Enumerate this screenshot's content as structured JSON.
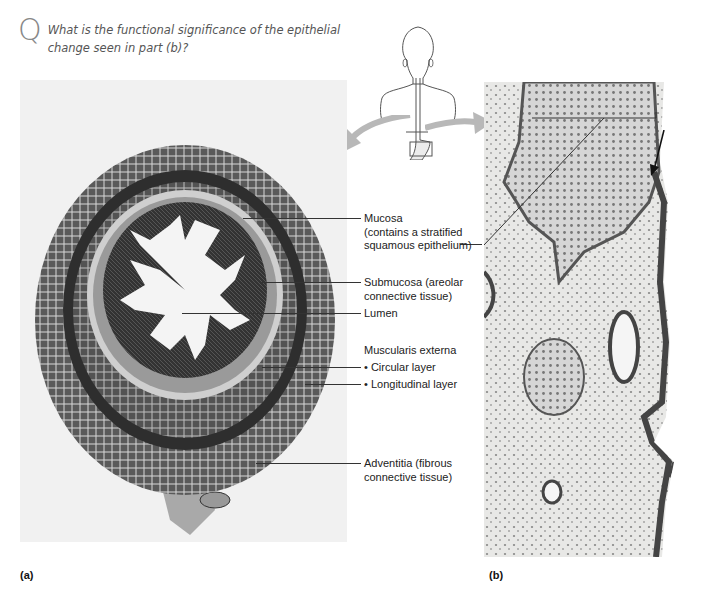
{
  "question": {
    "glyph": "Q",
    "text": "What is the functional significance of the epithelial change seen in part (b)?"
  },
  "figure_a": {
    "label": "(a)",
    "description": "Cross section of esophagus, light micrograph"
  },
  "figure_b": {
    "label": "(b)",
    "description": "Higher magnification of esophagus-stomach junction showing stratified squamous to simple columnar epithelial transition"
  },
  "orientation_icon": {
    "name": "human-torso-esophagus-icon"
  },
  "callouts": [
    {
      "id": "mucosa",
      "lines": [
        "Mucosa",
        "(contains a stratified",
        "squamous epithelium)"
      ]
    },
    {
      "id": "submucosa",
      "lines": [
        "Submucosa (areolar",
        "connective tissue)"
      ]
    },
    {
      "id": "lumen",
      "lines": [
        "Lumen"
      ]
    },
    {
      "id": "muscularis",
      "lines": [
        "Muscularis externa"
      ]
    },
    {
      "id": "circular",
      "lines": [
        "• Circular layer"
      ]
    },
    {
      "id": "longitudinal",
      "lines": [
        "• Longitudinal layer"
      ]
    },
    {
      "id": "adventitia",
      "lines": [
        "Adventitia (fibrous",
        "connective tissue)"
      ]
    }
  ],
  "colors": {
    "arrow_gray": "#b8b8b8",
    "tissue_dark": "#3a3a3a",
    "tissue_mid": "#6e6e6e",
    "tissue_light": "#bdbdbd",
    "background_panel": "#f1f1f1"
  }
}
